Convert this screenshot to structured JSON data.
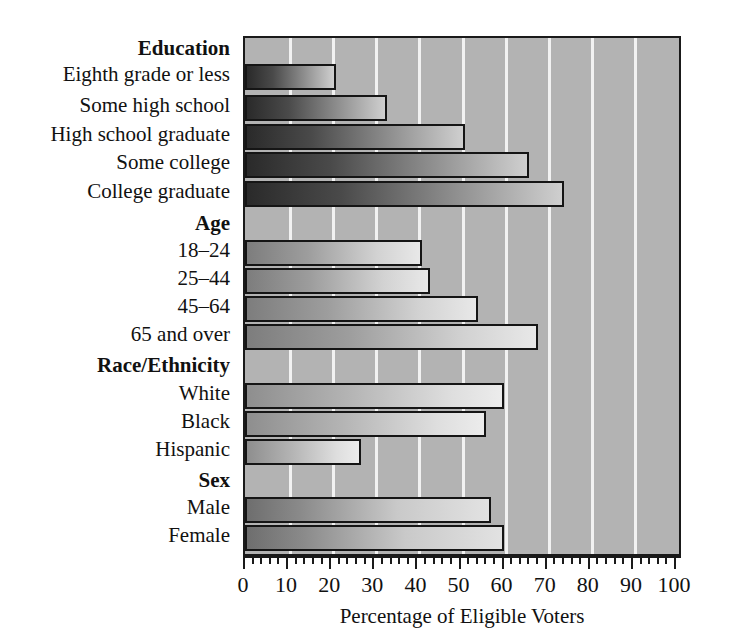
{
  "chart_data": {
    "type": "bar",
    "orientation": "horizontal",
    "title": "",
    "xlabel": "Percentage of Eligible Voters",
    "ylabel": "",
    "xlim": [
      0,
      100
    ],
    "xticks": [
      0,
      10,
      20,
      30,
      40,
      50,
      60,
      70,
      80,
      90,
      100
    ],
    "xtick_labels": [
      "0",
      "10",
      "20",
      "30",
      "40",
      "50",
      "60",
      "70",
      "80",
      "90",
      "100"
    ],
    "minor_tick_step": 2,
    "grid": "vertical-white-gridlines",
    "legend": "none",
    "background_color": "#b3b3b3",
    "bar_outline_color": "#151515",
    "groups": [
      {
        "name": "Education",
        "categories": [
          "Eighth grade or less",
          "Some high school",
          "High school graduate",
          "Some college",
          "College graduate"
        ],
        "values": [
          21,
          33,
          51,
          66,
          74
        ],
        "tone": "dark"
      },
      {
        "name": "Age",
        "categories": [
          "18–24",
          "25–44",
          "45–64",
          "65 and over"
        ],
        "values": [
          41,
          43,
          54,
          68
        ],
        "tone": "mid"
      },
      {
        "name": "Race/Ethnicity",
        "categories": [
          "White",
          "Black",
          "Hispanic"
        ],
        "values": [
          60,
          56,
          27
        ],
        "tone": "light"
      },
      {
        "name": "Sex",
        "categories": [
          "Male",
          "Female"
        ],
        "values": [
          57,
          60
        ],
        "tone": "darkest"
      }
    ],
    "categories": [
      "Eighth grade or less",
      "Some high school",
      "High school graduate",
      "Some college",
      "College graduate",
      "18–24",
      "25–44",
      "45–64",
      "65 and over",
      "White",
      "Black",
      "Hispanic",
      "Male",
      "Female"
    ],
    "values": [
      21,
      33,
      51,
      66,
      74,
      41,
      43,
      54,
      68,
      60,
      56,
      27,
      57,
      60
    ]
  },
  "rows": [
    {
      "kind": "group",
      "text": "Education",
      "y": 38
    },
    {
      "kind": "bar",
      "text": "Eighth grade or less",
      "y": 64,
      "value": 21,
      "tone": "tone-dark"
    },
    {
      "kind": "bar",
      "text": "Some high school",
      "y": 95,
      "value": 33,
      "tone": "tone-dark"
    },
    {
      "kind": "bar",
      "text": "High school graduate",
      "y": 124,
      "value": 51,
      "tone": "tone-dark"
    },
    {
      "kind": "bar",
      "text": "Some college",
      "y": 152,
      "value": 66,
      "tone": "tone-dark"
    },
    {
      "kind": "bar",
      "text": "College graduate",
      "y": 181,
      "value": 74,
      "tone": "tone-dark"
    },
    {
      "kind": "group",
      "text": "Age",
      "y": 213
    },
    {
      "kind": "bar",
      "text": "18–24",
      "y": 240,
      "value": 41,
      "tone": "tone-mid"
    },
    {
      "kind": "bar",
      "text": "25–44",
      "y": 268,
      "value": 43,
      "tone": "tone-mid"
    },
    {
      "kind": "bar",
      "text": "45–64",
      "y": 296,
      "value": 54,
      "tone": "tone-mid"
    },
    {
      "kind": "bar",
      "text": "65 and over",
      "y": 324,
      "value": 68,
      "tone": "tone-mid"
    },
    {
      "kind": "group",
      "text": "Race/Ethnicity",
      "y": 355
    },
    {
      "kind": "bar",
      "text": "White",
      "y": 383,
      "value": 60,
      "tone": "tone-light"
    },
    {
      "kind": "bar",
      "text": "Black",
      "y": 411,
      "value": 56,
      "tone": "tone-light"
    },
    {
      "kind": "bar",
      "text": "Hispanic",
      "y": 439,
      "value": 27,
      "tone": "tone-light"
    },
    {
      "kind": "group",
      "text": "Sex",
      "y": 470
    },
    {
      "kind": "bar",
      "text": "Male",
      "y": 497,
      "value": 57,
      "tone": "tone-darkest"
    },
    {
      "kind": "bar",
      "text": "Female",
      "y": 525,
      "value": 60,
      "tone": "tone-darkest"
    }
  ]
}
